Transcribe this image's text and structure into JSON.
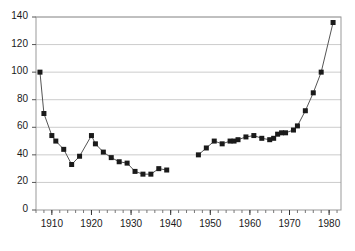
{
  "chart_data": {
    "type": "line",
    "title": "",
    "subtitle": "",
    "xlabel": "",
    "ylabel": "",
    "xlim": [
      1906,
      1983
    ],
    "ylim": [
      0,
      140
    ],
    "grid": true,
    "grid_axis": "y",
    "legend": false,
    "legend_position": "none",
    "marker": "square",
    "marker_color": "#1a1a1a",
    "line_color": "#555555",
    "background_color": "#ffffff",
    "frame_color": "#999999",
    "gridline_color": "#cccccc",
    "y_ticks": [
      0,
      20,
      40,
      60,
      80,
      100,
      120,
      140
    ],
    "y_tick_labels": [
      "0",
      "20",
      "40",
      "60",
      "80",
      "100",
      "120",
      "140"
    ],
    "x_ticks": [
      1910,
      1920,
      1930,
      1940,
      1950,
      1960,
      1970,
      1980
    ],
    "x_tick_labels": [
      "1910",
      "1920",
      "1930",
      "1940",
      "1950",
      "1960",
      "1970",
      "1980"
    ],
    "x_minor_tick_step": 2,
    "segments": [
      {
        "name": "pre-war",
        "points": [
          {
            "x": 1907,
            "y": 100
          },
          {
            "x": 1908,
            "y": 70
          },
          {
            "x": 1910,
            "y": 54
          },
          {
            "x": 1911,
            "y": 50
          },
          {
            "x": 1913,
            "y": 44
          },
          {
            "x": 1915,
            "y": 33
          },
          {
            "x": 1917,
            "y": 39
          },
          {
            "x": 1920,
            "y": 54
          },
          {
            "x": 1921,
            "y": 48
          },
          {
            "x": 1923,
            "y": 42
          },
          {
            "x": 1925,
            "y": 38
          },
          {
            "x": 1927,
            "y": 35
          },
          {
            "x": 1929,
            "y": 34
          },
          {
            "x": 1931,
            "y": 28
          },
          {
            "x": 1933,
            "y": 26
          },
          {
            "x": 1935,
            "y": 26
          },
          {
            "x": 1937,
            "y": 30
          },
          {
            "x": 1939,
            "y": 29
          }
        ]
      },
      {
        "name": "post-war",
        "points": [
          {
            "x": 1947,
            "y": 40
          },
          {
            "x": 1949,
            "y": 45
          },
          {
            "x": 1951,
            "y": 50
          },
          {
            "x": 1953,
            "y": 48
          },
          {
            "x": 1955,
            "y": 50
          },
          {
            "x": 1956,
            "y": 50
          },
          {
            "x": 1957,
            "y": 51
          },
          {
            "x": 1959,
            "y": 53
          },
          {
            "x": 1961,
            "y": 54
          },
          {
            "x": 1963,
            "y": 52
          },
          {
            "x": 1965,
            "y": 51
          },
          {
            "x": 1966,
            "y": 52
          },
          {
            "x": 1967,
            "y": 55
          },
          {
            "x": 1968,
            "y": 56
          },
          {
            "x": 1969,
            "y": 56
          },
          {
            "x": 1971,
            "y": 58
          },
          {
            "x": 1972,
            "y": 61
          },
          {
            "x": 1974,
            "y": 72
          },
          {
            "x": 1976,
            "y": 85
          },
          {
            "x": 1978,
            "y": 100
          },
          {
            "x": 1981,
            "y": 136
          }
        ]
      }
    ]
  }
}
